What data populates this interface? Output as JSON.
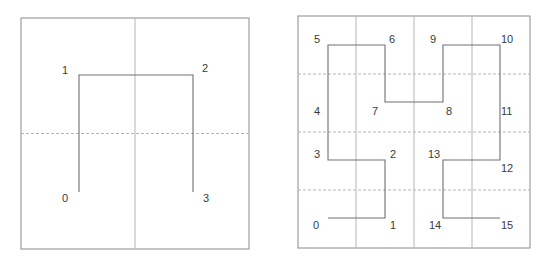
{
  "figure": {
    "panels": [
      {
        "id": "order-1",
        "box": {
          "x1": 21,
          "y1": 18,
          "x2": 249,
          "y2": 249
        },
        "grid": 2,
        "vertices": [
          {
            "label": "0",
            "x": 79,
            "y": 192,
            "lx": 62,
            "ly": 202
          },
          {
            "label": "1",
            "x": 79,
            "y": 75,
            "lx": 62,
            "ly": 74
          },
          {
            "label": "2",
            "x": 193,
            "y": 75,
            "lx": 202,
            "ly": 72
          },
          {
            "label": "3",
            "x": 193,
            "y": 192,
            "lx": 203,
            "ly": 202
          }
        ]
      },
      {
        "id": "order-2",
        "box": {
          "x1": 298,
          "y1": 16,
          "x2": 530,
          "y2": 248
        },
        "grid": 4,
        "vertices": [
          {
            "label": "0",
            "x": 328,
            "y": 218,
            "lx": 313,
            "ly": 229
          },
          {
            "label": "1",
            "x": 385,
            "y": 218,
            "lx": 390,
            "ly": 229
          },
          {
            "label": "2",
            "x": 385,
            "y": 160,
            "lx": 390,
            "ly": 158
          },
          {
            "label": "3",
            "x": 328,
            "y": 160,
            "lx": 314,
            "ly": 158
          },
          {
            "label": "4",
            "x": 328,
            "y": 102,
            "lx": 314,
            "ly": 115
          },
          {
            "label": "5",
            "x": 328,
            "y": 45,
            "lx": 314,
            "ly": 43
          },
          {
            "label": "6",
            "x": 385,
            "y": 45,
            "lx": 389,
            "ly": 43
          },
          {
            "label": "7",
            "x": 385,
            "y": 102,
            "lx": 372,
            "ly": 115
          },
          {
            "label": "8",
            "x": 443,
            "y": 102,
            "lx": 446,
            "ly": 115
          },
          {
            "label": "9",
            "x": 443,
            "y": 45,
            "lx": 430,
            "ly": 43
          },
          {
            "label": "10",
            "x": 500,
            "y": 45,
            "lx": 501,
            "ly": 43
          },
          {
            "label": "11",
            "x": 500,
            "y": 102,
            "lx": 501,
            "ly": 115
          },
          {
            "label": "12",
            "x": 500,
            "y": 160,
            "lx": 501,
            "ly": 172
          },
          {
            "label": "13",
            "x": 443,
            "y": 160,
            "lx": 428,
            "ly": 158
          },
          {
            "label": "14",
            "x": 443,
            "y": 218,
            "lx": 429,
            "ly": 229
          },
          {
            "label": "15",
            "x": 500,
            "y": 218,
            "lx": 501,
            "ly": 229
          }
        ]
      }
    ],
    "colors": {
      "frame": "#8a8a8a",
      "grid": "#b5b5b5",
      "curve": "#707070",
      "label": "#3a3a3a"
    }
  }
}
